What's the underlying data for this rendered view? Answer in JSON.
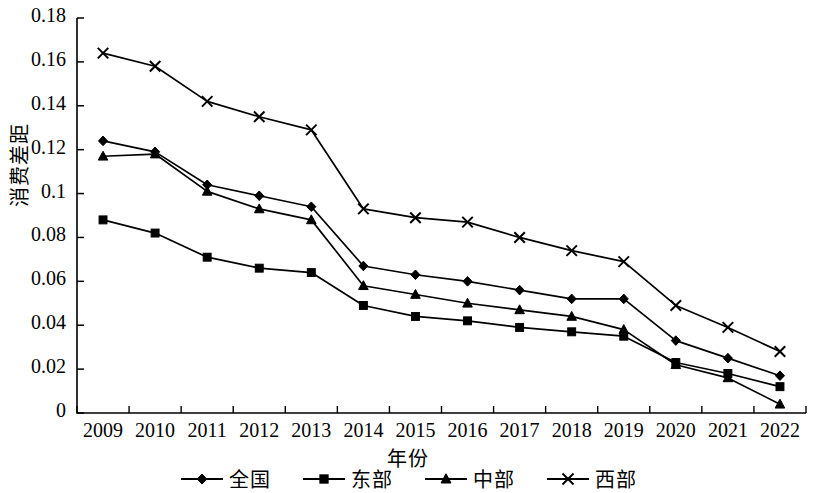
{
  "chart_data": {
    "type": "line",
    "title": "",
    "xlabel": "年份",
    "ylabel": "消费差距",
    "categories": [
      "2009",
      "2010",
      "2011",
      "2012",
      "2013",
      "2014",
      "2015",
      "2016",
      "2017",
      "2018",
      "2019",
      "2020",
      "2021",
      "2022"
    ],
    "ylim": [
      0,
      0.18
    ],
    "yticks": [
      "0",
      "0.02",
      "0.04",
      "0.06",
      "0.08",
      "0.1",
      "0.12",
      "0.14",
      "0.16",
      "0.18"
    ],
    "ytick_values": [
      0,
      0.02,
      0.04,
      0.06,
      0.08,
      0.1,
      0.12,
      0.14,
      0.16,
      0.18
    ],
    "grid": false,
    "legend_position": "bottom",
    "series": [
      {
        "name": "全国",
        "marker": "diamond",
        "color": "#000000",
        "values": [
          0.124,
          0.119,
          0.104,
          0.099,
          0.094,
          0.067,
          0.063,
          0.06,
          0.056,
          0.052,
          0.052,
          0.033,
          0.025,
          0.017
        ]
      },
      {
        "name": "东部",
        "marker": "square",
        "color": "#000000",
        "values": [
          0.088,
          0.082,
          0.071,
          0.066,
          0.064,
          0.049,
          0.044,
          0.042,
          0.039,
          0.037,
          0.035,
          0.023,
          0.018,
          0.012
        ]
      },
      {
        "name": "中部",
        "marker": "triangle",
        "color": "#000000",
        "values": [
          0.117,
          0.118,
          0.101,
          0.093,
          0.088,
          0.058,
          0.054,
          0.05,
          0.047,
          0.044,
          0.038,
          0.022,
          0.016,
          0.004
        ]
      },
      {
        "name": "西部",
        "marker": "cross",
        "color": "#000000",
        "values": [
          0.164,
          0.158,
          0.142,
          0.135,
          0.129,
          0.093,
          0.089,
          0.087,
          0.08,
          0.074,
          0.069,
          0.049,
          0.039,
          0.028
        ]
      }
    ]
  },
  "legend": {
    "items": [
      {
        "label": "全国",
        "marker": "diamond"
      },
      {
        "label": "东部",
        "marker": "square"
      },
      {
        "label": "中部",
        "marker": "triangle"
      },
      {
        "label": "西部",
        "marker": "cross"
      }
    ]
  },
  "axis": {
    "y_title": "消费差距",
    "x_title": "年份"
  }
}
